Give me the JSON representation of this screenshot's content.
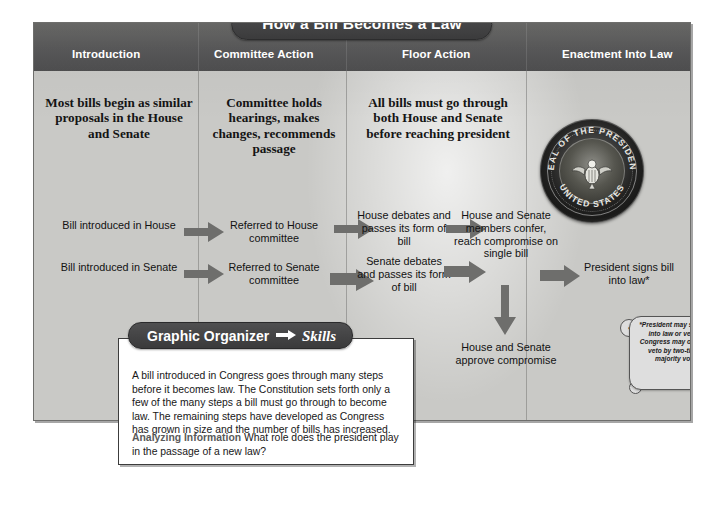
{
  "poster": {
    "title": "How a Bill Becomes a Law",
    "columns": [
      {
        "id": "introduction",
        "label": "Introduction"
      },
      {
        "id": "committee-action",
        "label": "Committee Action"
      },
      {
        "id": "floor-action",
        "label": "Floor Action"
      },
      {
        "id": "enactment-into-law",
        "label": "Enactment Into Law"
      }
    ],
    "summaries": [
      {
        "id": "introduction-summary",
        "text": "Most bills begin as similar proposals in the House and Senate"
      },
      {
        "id": "committee-action-summary",
        "text": "Committee holds hearings, makes changes, recommends passage"
      },
      {
        "id": "floor-action-summary",
        "text": "All bills must go through both House and Senate before reaching president"
      }
    ],
    "steps": {
      "intro_house": "Bill introduced in House",
      "intro_senate": "Bill introduced in Senate",
      "committee_house": "Referred to House committee",
      "committee_senate": "Referred to Senate committee",
      "floor_house": "House debates and passes its form of bill",
      "floor_senate": "Senate debates and passes its form of bill",
      "conference": "House and Senate members confer, reach compromise on single bill",
      "approve": "House and Senate approve compromise",
      "president": "President signs bill into law*"
    },
    "footnote": "*President may sign bill into law or veto it. Congress may override veto by two-thirds majority vote.",
    "seal": {
      "name": "presidential-seal",
      "top_text": "SEAL OF THE PRESIDENT",
      "bottom_text": "UNITED STATES"
    }
  },
  "organizer": {
    "tab_title": "Graphic Organizer",
    "tab_skills": "Skills",
    "paragraph": "A bill introduced in Congress goes through many steps before it becomes law. The Constitution sets forth only a few of the many steps a bill must go through to become law. The remaining steps have developed as Congress has grown in size and the number of bills has increased.",
    "question_label": "Analyzing Information",
    "question_text": "What role does the president play in the passage of a new law?"
  },
  "colors": {
    "header_band": "#59595a",
    "poster_bg": "#c9c9c6",
    "pill": "#3b3b3c",
    "arrow": "#6e6e6c",
    "text": "#141414",
    "question_label": "#5a5a5a"
  }
}
